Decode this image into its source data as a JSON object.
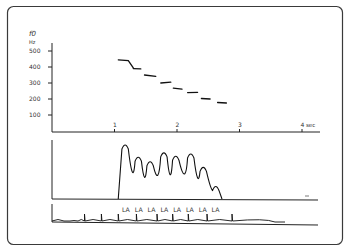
{
  "figure": {
    "frame_color": "#3a3a3a",
    "ink_color": "#222222"
  },
  "chart_data": [
    {
      "type": "line",
      "title": "",
      "ylabel": "f0",
      "ylabel_unit": "Hz",
      "xlabel": "sec",
      "y_ticks": [
        "100",
        "200",
        "300",
        "400",
        "500"
      ],
      "x_ticks": [
        "1",
        "2",
        "3",
        "4"
      ],
      "ylim": [
        0,
        550
      ],
      "xlim": [
        0,
        4
      ],
      "series": [
        {
          "name": "f0 contour",
          "segments": [
            {
              "x": [
                1.06,
                1.22,
                1.3
              ],
              "y": [
                445,
                440,
                395
              ]
            },
            {
              "x": [
                1.3,
                1.42
              ],
              "y": [
                390,
                388
              ]
            },
            {
              "x": [
                1.48,
                1.66
              ],
              "y": [
                350,
                342
              ]
            },
            {
              "x": [
                1.74,
                1.9
              ],
              "y": [
                300,
                305
              ]
            },
            {
              "x": [
                1.94,
                2.08
              ],
              "y": [
                268,
                262
              ]
            },
            {
              "x": [
                2.17,
                2.33
              ],
              "y": [
                240,
                242
              ]
            },
            {
              "x": [
                2.39,
                2.53
              ],
              "y": [
                203,
                200
              ]
            },
            {
              "x": [
                2.65,
                2.79
              ],
              "y": [
                178,
                175
              ]
            }
          ]
        }
      ]
    },
    {
      "type": "line",
      "title": "amplitude envelope",
      "peaks_sec": [
        1.17,
        1.38,
        1.57,
        1.79,
        1.98,
        2.22,
        2.42,
        2.62
      ],
      "peaks_relative": [
        1.0,
        0.78,
        0.7,
        0.86,
        0.8,
        0.84,
        0.6,
        0.26
      ]
    },
    {
      "type": "line",
      "title": "waveform / syllables",
      "syllables": [
        "LA",
        "LA",
        "LA",
        "LA",
        "LA",
        "LA",
        "LA",
        "LA"
      ]
    }
  ]
}
